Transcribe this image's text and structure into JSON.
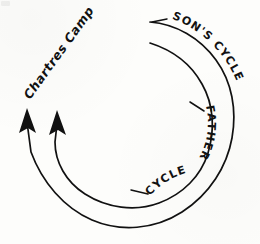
{
  "diagram": {
    "type": "hand-drawn-cycle-diagram",
    "background_color": "#fdfdfb",
    "ink_color": "#111111",
    "labels": {
      "sons_cycle": "SON'S CYCLE",
      "fathers_cycle": "FATHER'S CYCLE",
      "chartres_camp": "Chartres Camp"
    },
    "label_segments": {
      "sons_cycle_text": "SON'S  CYCLE",
      "fathers_cycle_upper": "FATHER'S",
      "fathers_cycle_lower": "CYCLE",
      "chartres_camp_text": "Chartres  Camp"
    },
    "arcs": [
      {
        "name": "outer-arc",
        "belongs_to": "SON'S CYCLE",
        "center": [
          128,
          124
        ],
        "radius": 104,
        "start_angle_deg": -84,
        "end_angle_deg": 193,
        "direction": "clockwise",
        "terminator": "arrowhead"
      },
      {
        "name": "inner-arc",
        "belongs_to": "FATHER'S CYCLE",
        "center": [
          128,
          124
        ],
        "radius": 82,
        "start_angle_deg": -62,
        "end_angle_deg": 190,
        "direction": "clockwise",
        "terminator": "arrowhead"
      }
    ],
    "arrowheads": [
      {
        "name": "outer-arrowhead",
        "tip": [
          27,
          110
        ],
        "points_to": "up"
      },
      {
        "name": "inner-arrowhead",
        "tip": [
          57,
          112
        ],
        "points_to": "up"
      }
    ],
    "leader_dashes": [
      {
        "name": "sons-cycle-leader",
        "from": [
          153,
          22
        ],
        "to": [
          166,
          20
        ]
      },
      {
        "name": "fathers-cycle-upper-leader",
        "from": [
          190,
          104
        ],
        "to": [
          203,
          110
        ]
      },
      {
        "name": "fathers-cycle-lower-leader",
        "from": [
          132,
          191
        ],
        "to": [
          148,
          194
        ]
      }
    ]
  }
}
